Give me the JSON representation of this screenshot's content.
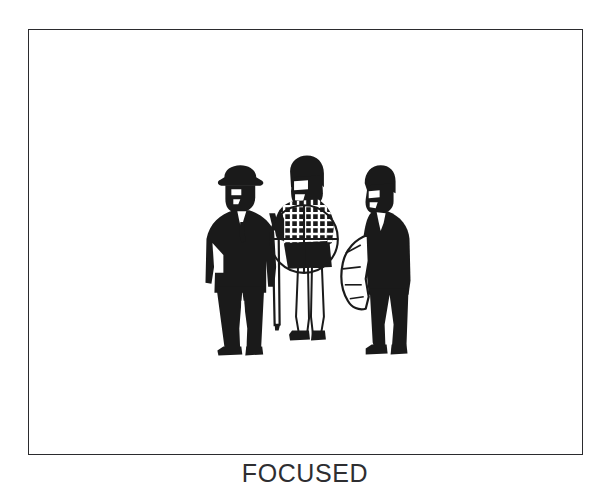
{
  "plate": {
    "caption": "FOCUSED",
    "frame": {
      "x": 28,
      "y": 29,
      "width": 555,
      "height": 426,
      "border_color": "#2b2b2e",
      "background_color": "#ffffff"
    }
  },
  "illustration": {
    "title": "FOCUSED",
    "style": "black-and-white line-art silhouette illustration",
    "ink_color": "#1a1a1a",
    "paper_color": "#ffffff",
    "figures": [
      {
        "id": "left-man",
        "label": "man in fedora with umbrella",
        "description": "standing man in dark suit and brimmed hat, hand on hip, holding a furled umbrella at his side",
        "facing": "right",
        "fill": "solid-black"
      },
      {
        "id": "center-woman",
        "label": "woman in checkered top",
        "description": "woman with bobbed hair in a plaid/checkered jacket and dark skirt, standing between the two men",
        "facing": "right",
        "fill": "checkered-and-black"
      },
      {
        "id": "right-man",
        "label": "man with coat over arm",
        "description": "standing man in dark suit with a light coat draped over his forearm, hand in pocket",
        "facing": "left",
        "fill": "solid-black"
      }
    ],
    "overlay": {
      "id": "crosshair-reticle",
      "label": "targeting reticle",
      "shape": "circle with horizontal and vertical crosshair lines",
      "center_x": 304,
      "center_y": 239,
      "radius": 34,
      "stroke_color": "#1a1a1a",
      "targets": "center-woman"
    }
  }
}
